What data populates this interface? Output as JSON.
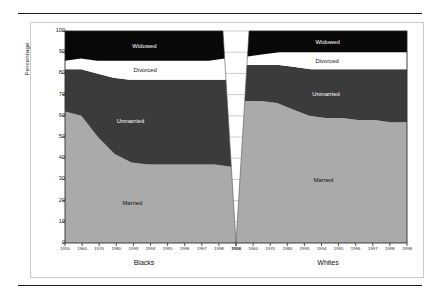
{
  "figure": {
    "ylabel": "Percentage",
    "y_ticks": [
      0,
      10,
      20,
      30,
      40,
      50,
      60,
      70,
      80,
      90,
      100
    ],
    "panels": [
      {
        "name": "Blacks",
        "label": "Blacks"
      },
      {
        "name": "Whites",
        "label": "Whites"
      }
    ],
    "x_tick_labels": [
      "1950",
      "1960",
      "1970",
      "1980",
      "1993",
      "1994",
      "1995",
      "1996",
      "1997",
      "1998",
      "1998"
    ],
    "band_labels": {
      "married": "Married",
      "unmarried": "Unmarried",
      "divorced": "Divorced",
      "widowed": "Widowed"
    },
    "colors": {
      "married": "#aaaaaa",
      "unmarried": "#3b3b3b",
      "divorced": "#ffffff",
      "widowed": "#080808",
      "frame": "#c9c9c9",
      "rule": "#1d1d1d",
      "axis": "#2b2b2b",
      "text": "#1a1a1a"
    }
  },
  "chart_data": {
    "type": "area",
    "title": "",
    "subtitle": "",
    "xlabel": "",
    "ylabel": "Percentage",
    "ylim": [
      0,
      100
    ],
    "grid": false,
    "legend_position": "inline-band-labels",
    "stacking": "stacked-to-100",
    "note": "Two side-by-side stacked area panels (Blacks, Whites) separated by a white wedge; values are percent of adults in each marital-status category.",
    "x": [
      "1950",
      "1960",
      "1970",
      "1980",
      "1993",
      "1994",
      "1995",
      "1996",
      "1997",
      "1998",
      "1998"
    ],
    "panels": [
      {
        "name": "Blacks",
        "series": [
          {
            "name": "Married",
            "color": "#aaaaaa",
            "values": [
              62,
              60,
              50,
              42,
              38,
              37,
              37,
              37,
              37,
              37,
              36
            ]
          },
          {
            "name": "Unmarried",
            "color": "#3b3b3b",
            "values": [
              20,
              22,
              30,
              36,
              39,
              40,
              40,
              40,
              40,
              40,
              41
            ]
          },
          {
            "name": "Divorced",
            "color": "#ffffff",
            "values": [
              4,
              5,
              6,
              8,
              9,
              9,
              9,
              9,
              9,
              9,
              10
            ]
          },
          {
            "name": "Widowed",
            "color": "#080808",
            "values": [
              14,
              13,
              14,
              14,
              14,
              14,
              14,
              14,
              14,
              14,
              13
            ]
          }
        ]
      },
      {
        "name": "Whites",
        "series": [
          {
            "name": "Married",
            "color": "#aaaaaa",
            "values": [
              67,
              67,
              66,
              63,
              60,
              59,
              59,
              58,
              58,
              57,
              57
            ]
          },
          {
            "name": "Unmarried",
            "color": "#3b3b3b",
            "values": [
              17,
              17,
              18,
              20,
              22,
              23,
              23,
              24,
              24,
              25,
              25
            ]
          },
          {
            "name": "Divorced",
            "color": "#ffffff",
            "values": [
              4,
              5,
              6,
              7,
              8,
              8,
              8,
              8,
              8,
              8,
              8
            ]
          },
          {
            "name": "Widowed",
            "color": "#080808",
            "values": [
              12,
              11,
              10,
              10,
              10,
              10,
              10,
              10,
              10,
              10,
              10
            ]
          }
        ]
      }
    ]
  }
}
